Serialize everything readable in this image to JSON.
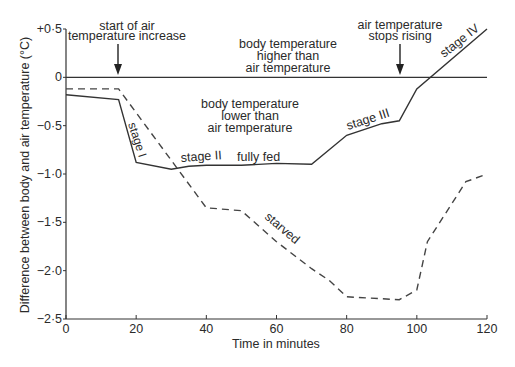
{
  "chart_data": {
    "type": "line",
    "title": "",
    "xlabel": "Time in minutes",
    "ylabel": "Difference between body and air temperature (°C)",
    "xlim": [
      0,
      120
    ],
    "ylim": [
      -2.5,
      0.5
    ],
    "grid": false,
    "x_ticks": [
      0,
      20,
      40,
      60,
      80,
      100,
      120
    ],
    "x_tick_labels": [
      "0",
      "20",
      "40",
      "60",
      "80",
      "100",
      "120"
    ],
    "y_ticks": [
      0.5,
      0,
      -0.5,
      -1.0,
      -1.5,
      -2.0,
      -2.5
    ],
    "y_tick_labels": [
      "+0·5",
      "0",
      "−0·5",
      "−1·0",
      "−1·5",
      "−2·0",
      "−2·5"
    ],
    "reference_line": {
      "y": 0,
      "x_range": [
        0,
        120
      ]
    },
    "series": [
      {
        "name": "fully fed",
        "style": "solid",
        "x": [
          0,
          15,
          20,
          30,
          35,
          40,
          50,
          60,
          70,
          80,
          90,
          95,
          100,
          120
        ],
        "values": [
          -0.18,
          -0.23,
          -0.88,
          -0.95,
          -0.92,
          -0.91,
          -0.91,
          -0.89,
          -0.9,
          -0.6,
          -0.48,
          -0.45,
          -0.12,
          0.5
        ]
      },
      {
        "name": "starved",
        "style": "dashed",
        "x": [
          0,
          15,
          40,
          50,
          60,
          70,
          75,
          80,
          95,
          100,
          103,
          114,
          120
        ],
        "values": [
          -0.12,
          -0.12,
          -1.35,
          -1.38,
          -1.7,
          -1.98,
          -2.1,
          -2.27,
          -2.3,
          -2.2,
          -1.7,
          -1.08,
          -1.0
        ]
      }
    ],
    "annotations": [
      {
        "text": "start of air temperature increase",
        "x": 15,
        "arrow_to_y": 0
      },
      {
        "text": "air temperature stops rising",
        "x": 95,
        "arrow_to_y": 0
      },
      {
        "text": "body temperature higher than air temperature",
        "region": "above zero"
      },
      {
        "text": "body temperature lower than air temperature",
        "region": "below zero"
      },
      {
        "text": "stage I",
        "x": 17
      },
      {
        "text": "stage II",
        "x": 37
      },
      {
        "text": "fully fed",
        "x": 55
      },
      {
        "text": "stage III",
        "x": 88
      },
      {
        "text": "stage IV",
        "x": 110
      },
      {
        "text": "starved",
        "x": 60
      }
    ]
  },
  "labels": {
    "xlabel": "Time in minutes",
    "ylabel": "Difference between body and air temperature (°C)",
    "ann_start_1": "start of air",
    "ann_start_2": "temperature increase",
    "ann_stop_1": "air temperature",
    "ann_stop_2": "stops rising",
    "above_1": "body temperature",
    "above_2": "higher than",
    "above_3": "air temperature",
    "below_1": "body temperature",
    "below_2": "lower than",
    "below_3": "air temperature",
    "stage1": "stage I",
    "stage2": "stage II",
    "fully_fed": "fully fed",
    "stage3": "stage III",
    "stage4": "stage IV",
    "starved": "starved"
  }
}
